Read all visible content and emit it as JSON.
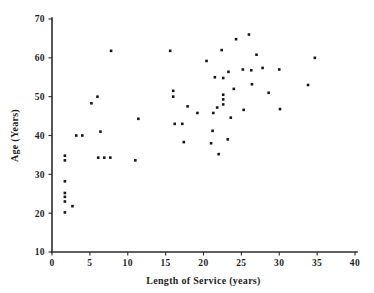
{
  "chart_data": {
    "type": "scatter",
    "title": "",
    "xlabel": "Length of Service (years)",
    "ylabel": "Age (Years)",
    "xlim": [
      0,
      40
    ],
    "ylim": [
      10,
      70
    ],
    "xticks": [
      0,
      5,
      10,
      15,
      20,
      25,
      30,
      35,
      40
    ],
    "xticklabels": [
      "0",
      "5",
      "10",
      "15",
      "20",
      "25",
      "30",
      "35",
      "40"
    ],
    "yticks": [
      10,
      20,
      30,
      40,
      50,
      60,
      70
    ],
    "yticklabels": [
      "10",
      "20",
      "30",
      "40",
      "50",
      "60",
      "70"
    ],
    "grid": false,
    "legend": null,
    "marker": "square-dot",
    "marker_color": "#161616",
    "axis_color": "#2b2b2b",
    "background": "#ffffff",
    "n_points": 56,
    "points": [
      {
        "x": 1.7,
        "y": 34.8
      },
      {
        "x": 1.7,
        "y": 33.6
      },
      {
        "x": 1.7,
        "y": 28.2
      },
      {
        "x": 1.7,
        "y": 25.2
      },
      {
        "x": 1.7,
        "y": 24.2
      },
      {
        "x": 1.7,
        "y": 23.0
      },
      {
        "x": 1.7,
        "y": 20.2
      },
      {
        "x": 2.7,
        "y": 21.8
      },
      {
        "x": 3.2,
        "y": 40.0
      },
      {
        "x": 4.0,
        "y": 40.0
      },
      {
        "x": 5.2,
        "y": 48.3
      },
      {
        "x": 6.0,
        "y": 50.0
      },
      {
        "x": 6.1,
        "y": 34.3
      },
      {
        "x": 6.9,
        "y": 34.3
      },
      {
        "x": 7.7,
        "y": 34.3
      },
      {
        "x": 7.8,
        "y": 61.8
      },
      {
        "x": 6.4,
        "y": 41.0
      },
      {
        "x": 11.0,
        "y": 33.6
      },
      {
        "x": 11.4,
        "y": 44.3
      },
      {
        "x": 15.6,
        "y": 61.8
      },
      {
        "x": 16.0,
        "y": 51.5
      },
      {
        "x": 16.0,
        "y": 50.0
      },
      {
        "x": 16.2,
        "y": 43.0
      },
      {
        "x": 17.2,
        "y": 43.0
      },
      {
        "x": 17.4,
        "y": 38.3
      },
      {
        "x": 17.9,
        "y": 47.5
      },
      {
        "x": 20.4,
        "y": 59.2
      },
      {
        "x": 21.5,
        "y": 55.0
      },
      {
        "x": 21.8,
        "y": 47.2
      },
      {
        "x": 21.3,
        "y": 45.8
      },
      {
        "x": 21.2,
        "y": 41.2
      },
      {
        "x": 21.0,
        "y": 38.0
      },
      {
        "x": 22.4,
        "y": 62.0
      },
      {
        "x": 22.6,
        "y": 54.8
      },
      {
        "x": 22.6,
        "y": 50.5
      },
      {
        "x": 22.6,
        "y": 49.3
      },
      {
        "x": 22.6,
        "y": 48.0
      },
      {
        "x": 22.0,
        "y": 35.2
      },
      {
        "x": 23.3,
        "y": 56.4
      },
      {
        "x": 23.6,
        "y": 44.6
      },
      {
        "x": 23.2,
        "y": 39.0
      },
      {
        "x": 24.3,
        "y": 64.8
      },
      {
        "x": 24.0,
        "y": 52.0
      },
      {
        "x": 25.2,
        "y": 57.0
      },
      {
        "x": 25.3,
        "y": 46.6
      },
      {
        "x": 26.0,
        "y": 66.0
      },
      {
        "x": 26.3,
        "y": 56.8
      },
      {
        "x": 26.4,
        "y": 53.2
      },
      {
        "x": 27.0,
        "y": 60.8
      },
      {
        "x": 27.8,
        "y": 57.4
      },
      {
        "x": 28.6,
        "y": 51.0
      },
      {
        "x": 30.0,
        "y": 57.0
      },
      {
        "x": 30.1,
        "y": 46.8
      },
      {
        "x": 33.8,
        "y": 53.0
      },
      {
        "x": 34.7,
        "y": 60.0
      },
      {
        "x": 19.2,
        "y": 45.8
      }
    ]
  }
}
